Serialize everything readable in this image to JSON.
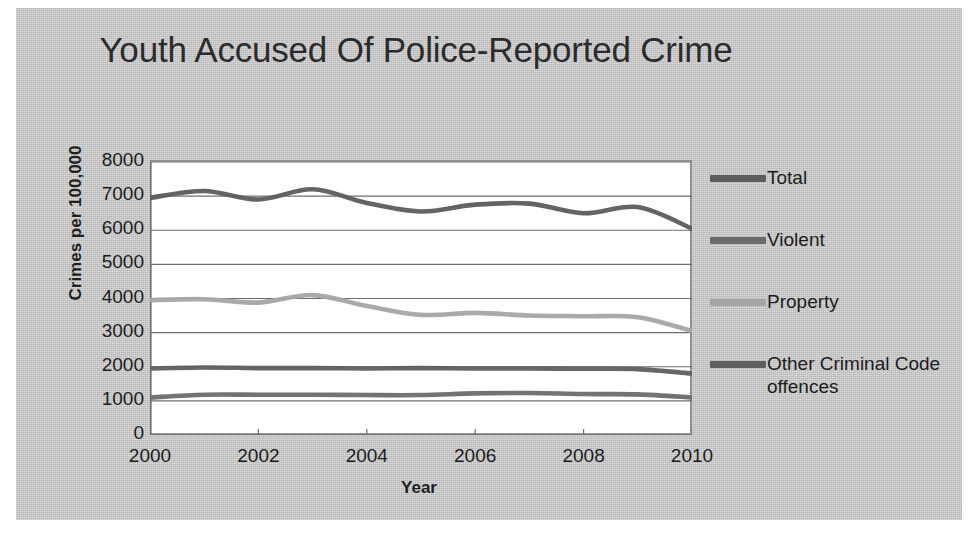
{
  "chart_data": {
    "type": "line",
    "title": "Youth Accused Of Police-Reported Crime",
    "xlabel": "Year",
    "ylabel": "Crimes per 100,000",
    "x": [
      2000,
      2001,
      2002,
      2003,
      2004,
      2005,
      2006,
      2007,
      2008,
      2009,
      2010
    ],
    "xlim": [
      2000,
      2010
    ],
    "ylim": [
      0,
      8000
    ],
    "x_ticks": [
      "2000",
      "2002",
      "2004",
      "2006",
      "2008",
      "2010"
    ],
    "x_tick_values": [
      2000,
      2002,
      2004,
      2006,
      2008,
      2010
    ],
    "y_ticks": [
      "0",
      "1000",
      "2000",
      "3000",
      "4000",
      "5000",
      "6000",
      "7000",
      "8000"
    ],
    "y_tick_values": [
      0,
      1000,
      2000,
      3000,
      4000,
      5000,
      6000,
      7000,
      8000
    ],
    "grid": "horizontal",
    "legend_position": "right",
    "series": [
      {
        "name": "Total",
        "color": "#5c5c5c",
        "values": [
          6950,
          7150,
          6900,
          7200,
          6800,
          6550,
          6750,
          6780,
          6500,
          6680,
          6050
        ]
      },
      {
        "name": "Violent",
        "color": "#6b6b6b",
        "values": [
          1100,
          1180,
          1180,
          1180,
          1170,
          1170,
          1220,
          1230,
          1200,
          1190,
          1100
        ]
      },
      {
        "name": "Property",
        "color": "#a5a5a5",
        "values": [
          3950,
          3980,
          3880,
          4100,
          3780,
          3520,
          3580,
          3500,
          3480,
          3450,
          3050
        ]
      },
      {
        "name": "Other Criminal Code offences",
        "color": "#5f5f5f",
        "values": [
          1950,
          1980,
          1960,
          1960,
          1950,
          1960,
          1950,
          1950,
          1940,
          1930,
          1800
        ]
      }
    ]
  },
  "figure": {
    "background_color": "#c9c9c9",
    "plot_background_color": "#ffffff",
    "axis_color": "#8f8f8f",
    "gridline_color": "#6e6e6e",
    "text_color": "#1c1c1c"
  }
}
